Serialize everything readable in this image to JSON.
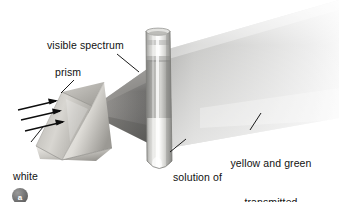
{
  "figure": {
    "background_color": "#ffffff",
    "width": 339,
    "height": 202
  },
  "labels": {
    "visible_spectrum": "visible spectrum",
    "prism": "prism",
    "white_light_line1": "white",
    "white_light_line2": "light",
    "solution_line1": "solution of",
    "solution_line2": "chlorophyll",
    "transmitted_line1": "yellow and green",
    "transmitted_line2": "transmitted"
  },
  "panel": {
    "marker_label": "a",
    "marker_color": "#6b6b6b"
  },
  "colors": {
    "text": "#111111",
    "leader_line": "#1a1a1a",
    "prism_light": "#f2f0ec",
    "prism_mid": "#c9c6c0",
    "prism_dark": "#8e8b85",
    "beam_dark": "#6f6f6f",
    "beam_light": "#d8d8d8",
    "tube_glass": "#cfcfcb",
    "tube_solution": "#9a9a96",
    "arrow": "#0d0d0d"
  },
  "elements": {
    "prism_name": "triangular glass prism",
    "tube_name": "test tube of chlorophyll solution",
    "incoming_beam": "white light beam with three arrows",
    "dispersed_beam": "visible spectrum cone from prism to tube",
    "transmitted_beam": "yellow and green light fan leaving the tube"
  }
}
